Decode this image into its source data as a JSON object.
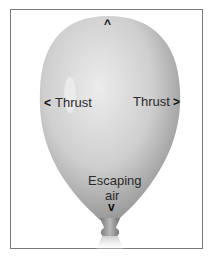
{
  "diagram": {
    "labels": {
      "thrust_left": "Thrust",
      "thrust_right": "Thrust",
      "escaping_line1": "Escaping",
      "escaping_line2": "air"
    },
    "arrows": {
      "up": "^",
      "left": "<",
      "right": ">",
      "down": "v"
    },
    "colors": {
      "frame": "#7a7a7a",
      "balloon_light": "#e4e4e4",
      "balloon_mid": "#bdbdbd",
      "balloon_dark": "#8e8e8e",
      "text": "#2a2a2a",
      "arrow": "#111111"
    }
  }
}
